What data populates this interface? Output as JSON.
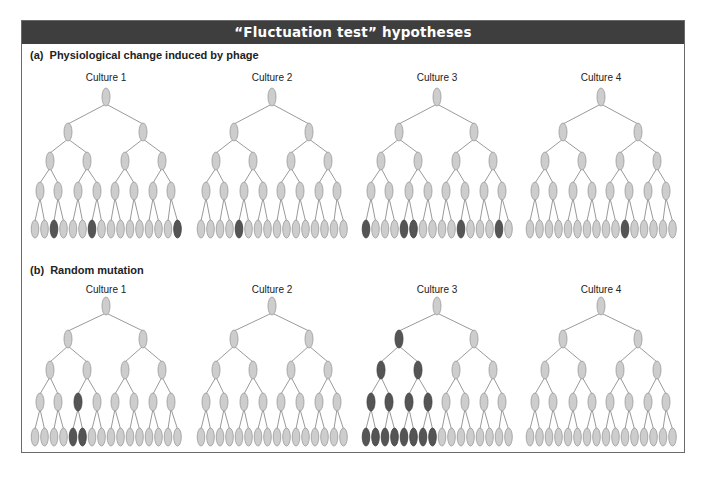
{
  "title": "“Fluctuation test” hypotheses",
  "colors": {
    "header_bg": "#3e3e3e",
    "node_light": "#cdcdcd",
    "node_dark": "#555555",
    "node_stroke": "#999999",
    "edge": "#9a9a9a"
  },
  "panels": [
    {
      "label": "(a)  Physiological change induced by phage",
      "cultures": [
        {
          "label": "Culture 1",
          "dark": {
            "l0": [],
            "l1": [],
            "l2": [],
            "l3": [],
            "l4": [
              3,
              7,
              16
            ]
          }
        },
        {
          "label": "Culture 2",
          "dark": {
            "l0": [],
            "l1": [],
            "l2": [],
            "l3": [],
            "l4": [
              5
            ]
          }
        },
        {
          "label": "Culture 3",
          "dark": {
            "l0": [],
            "l1": [],
            "l2": [],
            "l3": [],
            "l4": [
              1,
              5,
              6,
              11,
              15
            ]
          }
        },
        {
          "label": "Culture 4",
          "dark": {
            "l0": [],
            "l1": [],
            "l2": [],
            "l3": [],
            "l4": [
              11
            ]
          }
        }
      ]
    },
    {
      "label": "(b)  Random mutation",
      "cultures": [
        {
          "label": "Culture 1",
          "dark": {
            "l0": [],
            "l1": [],
            "l2": [],
            "l3": [
              3
            ],
            "l4": [
              5,
              6
            ]
          }
        },
        {
          "label": "Culture 2",
          "dark": {
            "l0": [],
            "l1": [],
            "l2": [],
            "l3": [],
            "l4": []
          }
        },
        {
          "label": "Culture 3",
          "dark": {
            "l0": [],
            "l1": [
              1
            ],
            "l2": [
              1,
              2
            ],
            "l3": [
              1,
              2,
              3,
              4
            ],
            "l4": [
              1,
              2,
              3,
              4,
              5,
              6,
              7,
              8
            ]
          }
        },
        {
          "label": "Culture 4",
          "dark": {
            "l0": [],
            "l1": [],
            "l2": [],
            "l3": [],
            "l4": []
          }
        }
      ]
    }
  ]
}
